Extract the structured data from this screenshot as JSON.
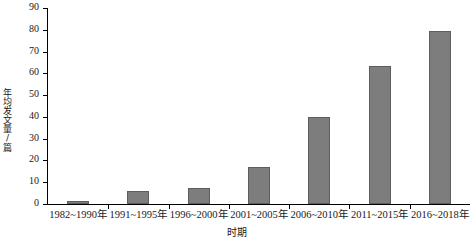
{
  "chart_data": {
    "type": "bar",
    "title": "",
    "xlabel": "时期",
    "ylabel": "年均发文量/篇",
    "categories": [
      "1982~1990年",
      "1991~1995年",
      "1996~2000年",
      "2001~2005年",
      "2006~2010年",
      "2011~2015年",
      "2016~2018年"
    ],
    "values": [
      1.5,
      6,
      7.5,
      17,
      40,
      63.5,
      79.5
    ],
    "ylim": [
      0,
      90
    ],
    "yticks": [
      0,
      10,
      20,
      30,
      40,
      50,
      60,
      70,
      80,
      90
    ],
    "ytick_labels": [
      "0",
      "10",
      "20",
      "30",
      "40",
      "50",
      "60",
      "70",
      "80",
      "90"
    ],
    "grid": false,
    "legend": null,
    "bar_color": "#7d7d7d",
    "bar_edge_color": "#5d5d5d",
    "axis_color": "#000000",
    "background_color": "#ffffff"
  }
}
